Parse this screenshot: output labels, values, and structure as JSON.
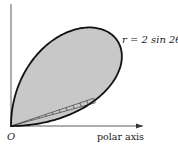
{
  "diagram": {
    "curve_label": "r = 2 sin 2θ",
    "origin_label": "O",
    "axis_label": "polar axis",
    "fill_color": "#c8c8c8",
    "stroke_color": "#111111"
  }
}
